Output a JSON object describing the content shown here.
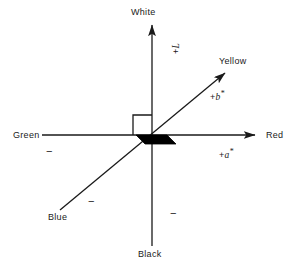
{
  "figure": {
    "background_color": "#ffffff",
    "line_color": "#1a1a1a",
    "fill_color": "#000000"
  },
  "axes": {
    "lightness": {
      "positive_label": "White",
      "positive_symbol_plus": "+",
      "positive_symbol_name": "L",
      "positive_symbol_star": "",
      "negative_label": "Black",
      "negative_sign": "−"
    },
    "a_star": {
      "positive_label": "Red",
      "positive_symbol_plus": "+",
      "positive_symbol_name": "a",
      "positive_symbol_star": "*",
      "negative_label": "Green",
      "negative_sign": "−"
    },
    "b_star": {
      "positive_label": "Yellow",
      "positive_symbol_plus": "+",
      "positive_symbol_name": "b",
      "positive_symbol_star": "*",
      "negative_label": "Blue",
      "negative_sign": "−"
    }
  },
  "markers": {
    "right_angle_square": "right-angle-square",
    "origin_patch": "black-parallelogram-patch"
  }
}
